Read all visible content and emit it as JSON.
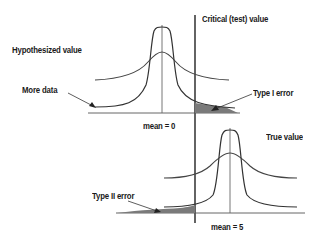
{
  "labels": {
    "critical": "Critical (test) value",
    "hypothesized": "Hypothesized value",
    "more_data": "More data",
    "type1": "Type I error",
    "mean0": "mean = 0",
    "true_value": "True value",
    "type2": "Type II error",
    "mean5": "mean = 5"
  },
  "colors": {
    "curve": "#3a3a3a",
    "line": "#333333",
    "shade": "#7a7a7a",
    "text": "#1a1a1a"
  }
}
